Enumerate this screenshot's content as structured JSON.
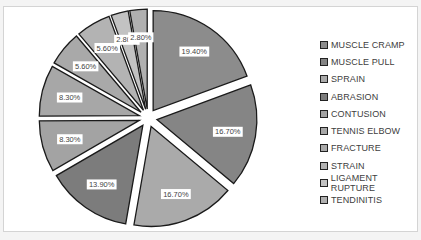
{
  "chart_data": {
    "type": "pie",
    "exploded": true,
    "title": "",
    "start_angle": "12 o'clock",
    "direction": "clockwise",
    "legend_position": "right",
    "slices": [
      {
        "label": "MUSCLE CRAMP",
        "value": 19.4,
        "display": "19.40%",
        "color": "#8c8c8c"
      },
      {
        "label": "MUSCLE PULL",
        "value": 16.7,
        "display": "16.70%",
        "color": "#858585"
      },
      {
        "label": "SPRAIN",
        "value": 16.7,
        "display": "16.70%",
        "color": "#aaaaaa"
      },
      {
        "label": "ABRASION",
        "value": 13.9,
        "display": "13.90%",
        "color": "#7c7c7c"
      },
      {
        "label": "CONTUSION",
        "value": 8.3,
        "display": "8.30%",
        "color": "#a3a3a3"
      },
      {
        "label": "TENNIS ELBOW",
        "value": 8.3,
        "display": "8.30%",
        "color": "#a7a7a7"
      },
      {
        "label": "FRACTURE",
        "value": 5.6,
        "display": "5.60%",
        "color": "#a9a9a9"
      },
      {
        "label": "STRAIN",
        "value": 5.6,
        "display": "5.60%",
        "color": "#b3b3b3"
      },
      {
        "label": "LIGAMENT RUPTURE",
        "value": 2.8,
        "display": "2.80%",
        "color": "#c2c2c2"
      },
      {
        "label": "TENDINITIS",
        "value": 2.8,
        "display": "2.80%",
        "color": "#b0b0b0"
      }
    ]
  }
}
